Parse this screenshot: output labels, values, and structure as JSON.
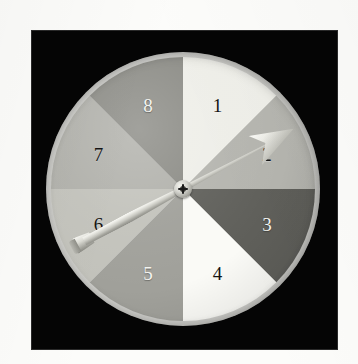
{
  "figure": {
    "kind": "spinner-wheel",
    "background_color": "#050505",
    "page_color": "#fcfcfa"
  },
  "spinner": {
    "rim_color": "#f2f2ec",
    "sector_count": 8,
    "sector_angle_deg": 45,
    "sectors": [
      {
        "number": "1",
        "start_deg": 0,
        "end_deg": 45,
        "fill": "#eeeee8",
        "label_color": "dark",
        "label_hex": "#141414"
      },
      {
        "number": "2",
        "start_deg": 45,
        "end_deg": 90,
        "fill": "#b4b4ae",
        "label_color": "dark",
        "label_hex": "#141414"
      },
      {
        "number": "3",
        "start_deg": 90,
        "end_deg": 135,
        "fill": "#5f5f5a",
        "label_color": "light",
        "label_hex": "#f4f4f0"
      },
      {
        "number": "4",
        "start_deg": 135,
        "end_deg": 180,
        "fill": "#fafaf6",
        "label_color": "dark",
        "label_hex": "#141414"
      },
      {
        "number": "5",
        "start_deg": 180,
        "end_deg": 225,
        "fill": "#a0a09a",
        "label_color": "light",
        "label_hex": "#f4f4f0"
      },
      {
        "number": "6",
        "start_deg": 225,
        "end_deg": 270,
        "fill": "#c2c2bb",
        "label_color": "dark",
        "label_hex": "#141414"
      },
      {
        "number": "7",
        "start_deg": 270,
        "end_deg": 315,
        "fill": "#b0b0aa",
        "label_color": "dark",
        "label_hex": "#141414"
      },
      {
        "number": "8",
        "start_deg": 315,
        "end_deg": 360,
        "fill": "#8a8a84",
        "label_color": "light",
        "label_hex": "#f4f4f0"
      }
    ]
  },
  "pointer": {
    "type": "arrow-needle",
    "bearing_deg": 62,
    "points_at_sector": "2",
    "hub": "center-screw"
  }
}
